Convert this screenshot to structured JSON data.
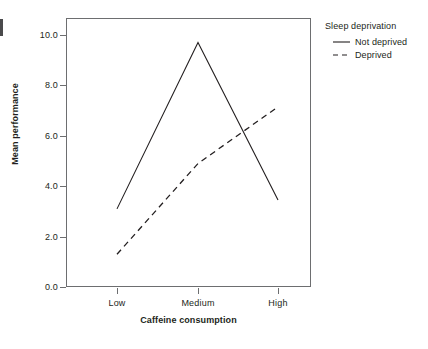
{
  "chart_data": {
    "type": "line",
    "title": "",
    "xlabel": "Caffeine consumption",
    "ylabel": "Mean performance",
    "categories": [
      "Low",
      "Medium",
      "High"
    ],
    "ylim": [
      0.0,
      10.65
    ],
    "yticks": [
      "0.0",
      "2.0",
      "4.0",
      "6.0",
      "8.0",
      "10.0"
    ],
    "ytick_values": [
      0.0,
      2.0,
      4.0,
      6.0,
      8.0,
      10.0
    ],
    "grid": false,
    "legend_position": "right",
    "legend_title": "Sleep deprivation",
    "series": [
      {
        "name": "Not deprived",
        "style": "solid",
        "color": "#231f20",
        "values": [
          3.1,
          9.7,
          3.45
        ]
      },
      {
        "name": "Deprived",
        "style": "dashed",
        "color": "#231f20",
        "values": [
          1.3,
          4.9,
          7.15
        ]
      }
    ]
  },
  "axes": {
    "ylabel": "Mean performance",
    "xlabel": "Caffeine consumption",
    "ytick_labels": [
      "10.0",
      "8.0",
      "6.0",
      "4.0",
      "2.0",
      "0.0"
    ],
    "xtick_labels": [
      "Low",
      "Medium",
      "High"
    ]
  },
  "legend": {
    "title": "Sleep deprivation",
    "entries": [
      {
        "label": "Not deprived",
        "style": "solid"
      },
      {
        "label": "Deprived",
        "style": "dashed"
      }
    ]
  }
}
